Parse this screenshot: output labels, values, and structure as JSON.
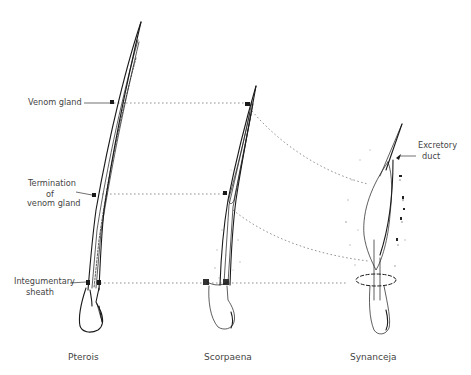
{
  "figure": {
    "labels": {
      "venom_gland": "Venom  gland",
      "termination_line1": "Termination",
      "termination_line2": "of",
      "termination_line3": "venom  gland",
      "integumentary_line1": "Integumentary",
      "integumentary_line2": "sheath",
      "excretory_line1": "Excretory",
      "excretory_line2": "duct"
    },
    "specimens": [
      {
        "id": "pterois",
        "caption": "Pterois"
      },
      {
        "id": "scorpaena",
        "caption": "Scorpaena"
      },
      {
        "id": "synanceja",
        "caption": "Synanceja"
      }
    ],
    "ink_color": "#1a1a1a",
    "guide_color": "#666666"
  }
}
